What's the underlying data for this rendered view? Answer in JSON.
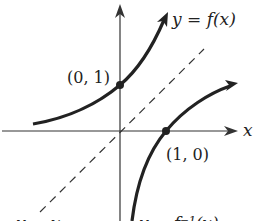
{
  "figure": {
    "curve_f_label": "y = f(x)",
    "curve_finv_label": "y = f⁻¹(x)",
    "identity_label": "y = x",
    "x_axis_label": "x",
    "points": [
      {
        "label": "(0, 1)"
      },
      {
        "label": "(1, 0)"
      }
    ],
    "colors": {
      "ink": "#222222",
      "background": "#ffffff"
    }
  }
}
